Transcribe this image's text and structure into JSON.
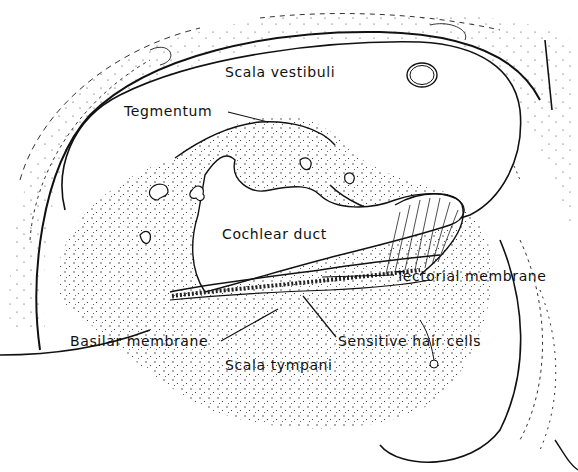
{
  "diagram": {
    "labels": {
      "scala_vestibuli": "Scala vestibuli",
      "tegmentum": "Tegmentum",
      "cochlear_duct": "Cochlear duct",
      "tectorial_membrane": "Tectorial membrane",
      "basilar_membrane": "Basilar membrane",
      "sensitive_hair_cells": "Sensitive hair cells",
      "scala_tympani": "Scala tympani"
    },
    "colors": {
      "ink": "#111111",
      "background": "#ffffff"
    }
  }
}
